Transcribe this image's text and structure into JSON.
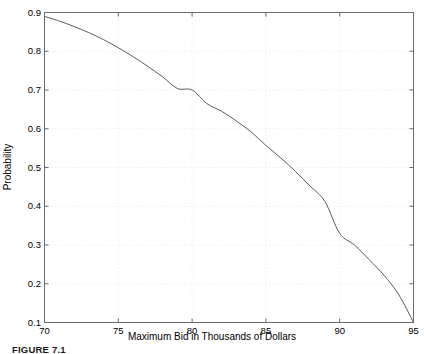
{
  "figure": {
    "caption": "FIGURE 7.1",
    "background_color": "#ffffff"
  },
  "chart_data": {
    "type": "line",
    "title": "",
    "subtitle": "",
    "xlabel": "Maximum Bid in Thousands of Dollars",
    "ylabel": "Probability",
    "xlim": [
      70,
      95
    ],
    "ylim": [
      0.1,
      0.9
    ],
    "xticks": [
      70,
      75,
      80,
      85,
      90,
      95
    ],
    "xtick_labels": [
      "70",
      "75",
      "80",
      "85",
      "90",
      "95"
    ],
    "yticks": [
      0.1,
      0.2,
      0.3,
      0.4,
      0.5,
      0.6,
      0.7,
      0.8,
      0.9
    ],
    "ytick_labels": [
      "0.1",
      "0.2",
      "0.3",
      "0.4",
      "0.5",
      "0.6",
      "0.7",
      "0.8",
      "0.9"
    ],
    "grid": true,
    "grid_style": "dotted",
    "grid_color": "#e2e2e2",
    "legend": null,
    "legend_position": "none",
    "annotations": [],
    "line_color": "#5a5a5a",
    "line_width": 1.0,
    "axis_color": "#6b6b6b",
    "series": [
      {
        "name": "Probability of winning",
        "x": [
          70,
          71,
          72,
          73,
          74,
          75,
          76,
          77,
          78,
          79,
          80,
          81,
          82,
          83,
          84,
          85,
          86,
          87,
          88,
          89,
          90,
          91,
          92,
          93,
          94,
          95
        ],
        "values": [
          0.89,
          0.878,
          0.864,
          0.848,
          0.83,
          0.809,
          0.786,
          0.761,
          0.734,
          0.704,
          0.7,
          0.665,
          0.645,
          0.62,
          0.592,
          0.557,
          0.525,
          0.49,
          0.452,
          0.412,
          0.33,
          0.3,
          0.262,
          0.222,
          0.172,
          0.1
        ]
      }
    ]
  },
  "axis_labels": {
    "x": [
      "70",
      "75",
      "80",
      "85",
      "90",
      "95"
    ],
    "y": [
      "0.9",
      "0.8",
      "0.7",
      "0.6",
      "0.5",
      "0.4",
      "0.3",
      "0.2",
      "0.1"
    ]
  }
}
